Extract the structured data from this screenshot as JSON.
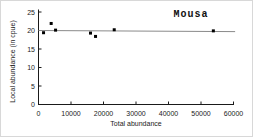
{
  "figure": {
    "background": "#ffffff",
    "border_color": "#d8d8d8",
    "axis_color": "#1a1a1a",
    "text_color": "#222222"
  },
  "chart_data": {
    "type": "scatter",
    "annotation": "Mousa",
    "xlabel": "Total abundance",
    "ylabel": "Local abundance (in cpue)",
    "xlim": [
      0,
      60000
    ],
    "ylim": [
      0,
      25
    ],
    "xticks": [
      0,
      10000,
      20000,
      30000,
      40000,
      50000,
      60000
    ],
    "yticks": [
      0,
      5,
      10,
      15,
      20,
      25
    ],
    "grid": false,
    "legend": "none",
    "marker": "square",
    "marker_color": "#000000",
    "points": [
      {
        "x": 1550,
        "y": 19.4
      },
      {
        "x": 3900,
        "y": 21.9
      },
      {
        "x": 5250,
        "y": 20.1
      },
      {
        "x": 16000,
        "y": 19.3
      },
      {
        "x": 17550,
        "y": 18.4
      },
      {
        "x": 23300,
        "y": 20.2
      },
      {
        "x": 53800,
        "y": 19.9
      }
    ],
    "trend_line": {
      "x": [
        0,
        60500
      ],
      "y": [
        20.0,
        19.7
      ],
      "color": "#8a8a8a"
    }
  }
}
